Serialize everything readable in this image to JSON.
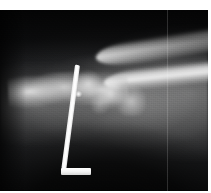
{
  "document": {
    "type": "radiograph",
    "modality": "X-ray",
    "view": "lateral",
    "body_part": "wrist and distal forearm",
    "caption": ""
  },
  "image": {
    "width": 211,
    "height": 193,
    "plate": {
      "x": 0,
      "y": 10,
      "width": 208,
      "height": 181,
      "background_color": "#0a0a0a"
    },
    "margins": {
      "top": 10,
      "right": 3,
      "bottom": 2,
      "left": 0,
      "color": "#ffffff"
    }
  },
  "anatomy": {
    "radius_shaft_label": "radius shaft",
    "ulna_shaft_label": "ulna shaft",
    "carpal_block_label": "carpal bones",
    "joint_detail_label": "metacarpal bases",
    "ossicle_label": "ossicle",
    "soft_tissue_label": "soft tissue envelope",
    "palmar_shadow_label": "palmar soft tissue shadow",
    "dorsal_shadow_label": "dorsal background field"
  },
  "hardware": {
    "name": "orthopaedic pin",
    "description": "T-shaped metallic pin with vertical shaft and transverse base plate",
    "shaft_color": "#ffffff",
    "base_color": "#f2f2f2",
    "shaft_angle_deg": 7.5,
    "shaft_length_px": 105,
    "base_width_px": 30
  },
  "artifacts": {
    "scan_line_label": "vertical collimator line",
    "scan_line_x": 167,
    "grain_label": "film grain"
  }
}
